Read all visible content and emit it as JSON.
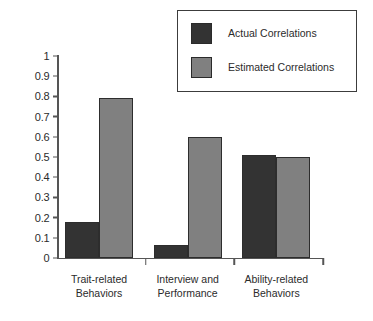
{
  "chart_data": {
    "type": "bar",
    "title": "",
    "subtitle": "",
    "xlabel": "",
    "ylabel": "",
    "ylim": [
      0,
      1
    ],
    "ytick_labels": [
      "1",
      "0.9",
      "0.8",
      "0.7",
      "0.6",
      "0.5",
      "0.4",
      "0.3",
      "0.2",
      "0.1",
      "0"
    ],
    "ytick_values": [
      1,
      0.9,
      0.8,
      0.7,
      0.6,
      0.5,
      0.4,
      0.3,
      0.2,
      0.1,
      0
    ],
    "grid": false,
    "legend_position": "top-right",
    "categories": [
      [
        "Trait-related",
        "Behaviors"
      ],
      [
        "Interview and",
        "Performance"
      ],
      [
        "Ability-related",
        "Behaviors"
      ]
    ],
    "category_labels_flat": [
      "Trait-related Behaviors",
      "Interview and Performance",
      "Ability-related Behaviors"
    ],
    "series": [
      {
        "name": "Actual Correlations",
        "color": "#333333",
        "values": [
          0.18,
          0.065,
          0.51
        ]
      },
      {
        "name": "Estimated Correlations",
        "color": "#808080",
        "values": [
          0.79,
          0.6,
          0.5
        ]
      }
    ],
    "annotations": []
  },
  "legend": {
    "items": [
      {
        "label": "Actual Correlations",
        "swatch": "legend-swatch-actual"
      },
      {
        "label": "Estimated Correlations",
        "swatch": "legend-swatch-estimated"
      }
    ]
  },
  "axis": {
    "y_ticks": [
      {
        "label": "1"
      },
      {
        "label": "0.9"
      },
      {
        "label": "0.8"
      },
      {
        "label": "0.7"
      },
      {
        "label": "0.6"
      },
      {
        "label": "0.5"
      },
      {
        "label": "0.4"
      },
      {
        "label": "0.3"
      },
      {
        "label": "0.2"
      },
      {
        "label": "0.1"
      },
      {
        "label": "0"
      }
    ]
  },
  "colors": {
    "actual": "#333333",
    "estimated": "#808080",
    "axis": "#555555",
    "text": "#2b2b2b",
    "background": "#ffffff",
    "legend_border": "#3c3c3c"
  }
}
